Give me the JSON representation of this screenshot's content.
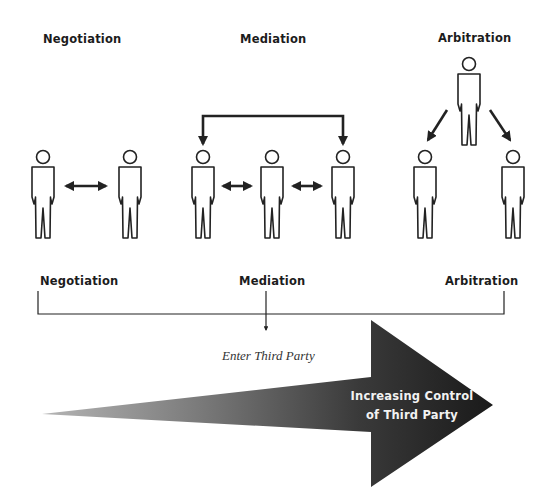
{
  "top_labels": {
    "negotiation": "Negotiation",
    "mediation": "Mediation",
    "arbitration": "Arbitration"
  },
  "scale": {
    "left_label": "Negotiation",
    "middle_label": "Mediation",
    "right_label": "Arbitration",
    "annotation": "Enter Third Party"
  },
  "big_arrow": {
    "line1": "Increasing Control",
    "line2": "of Third Party",
    "color_dark": "#1f1f1f",
    "color_light": "#9a9a9a"
  }
}
